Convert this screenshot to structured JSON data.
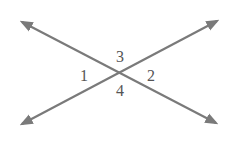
{
  "diagram": {
    "type": "intersecting-lines",
    "line_color": "#7a7a7a",
    "label_color": "#555555",
    "intersection": {
      "x": 117,
      "y": 72
    },
    "lines": [
      {
        "name": "line-a",
        "from": {
          "x": 22,
          "y": 22
        },
        "to": {
          "x": 216,
          "y": 123
        }
      },
      {
        "name": "line-b",
        "from": {
          "x": 22,
          "y": 124
        },
        "to": {
          "x": 217,
          "y": 21
        }
      }
    ],
    "angles": [
      {
        "id": "1",
        "label": "1",
        "position": "left",
        "x": 84,
        "y": 81
      },
      {
        "id": "2",
        "label": "2",
        "position": "right",
        "x": 151,
        "y": 81
      },
      {
        "id": "3",
        "label": "3",
        "position": "top",
        "x": 120,
        "y": 62
      },
      {
        "id": "4",
        "label": "4",
        "position": "bottom",
        "x": 120,
        "y": 96
      }
    ]
  }
}
